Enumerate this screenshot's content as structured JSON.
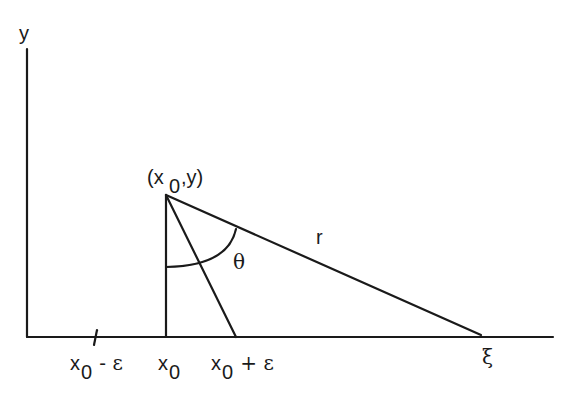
{
  "diagram": {
    "axes": {
      "y_label": "y"
    },
    "point_label": {
      "main_open": "(x",
      "subscript": "0",
      "main_close": ",y)"
    },
    "segment_labels": {
      "r": "r",
      "theta": "θ"
    },
    "x_labels": [
      {
        "base": "x",
        "sub": "0",
        "suffix": " - ε"
      },
      {
        "base": "x",
        "sub": "0",
        "suffix": ""
      },
      {
        "base": "x",
        "sub": "0",
        "suffix": " + ε"
      },
      {
        "base": "ξ",
        "sub": "",
        "suffix": ""
      }
    ]
  }
}
